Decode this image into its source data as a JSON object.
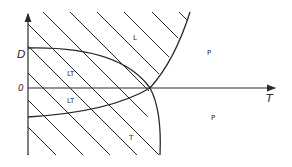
{
  "figure": {
    "type": "phase-diagram",
    "axes": {
      "x_label": "T",
      "y_label": "D",
      "origin_label": "0"
    },
    "regions": [
      {
        "id": "L",
        "label": "L",
        "hatched": true
      },
      {
        "id": "LT-upper",
        "label": "LT",
        "hatched": true
      },
      {
        "id": "LT-lower",
        "label": "LT",
        "hatched": true
      },
      {
        "id": "P-upper",
        "label": "P",
        "hatched": false
      },
      {
        "id": "P-lower",
        "label": "P",
        "hatched": false
      },
      {
        "id": "T",
        "label": "T",
        "hatched": true
      }
    ],
    "curves": [
      {
        "id": "upper-boundary",
        "description": "starts horizontal at D level on vertical axis, bends down through T-axis, ends near bottom"
      },
      {
        "id": "lower-boundary",
        "description": "starts below origin on vertical axis, rises through T-axis, continues up to top"
      }
    ],
    "colors": {
      "line": "#2a2a2a",
      "background": "#ffffff"
    }
  }
}
